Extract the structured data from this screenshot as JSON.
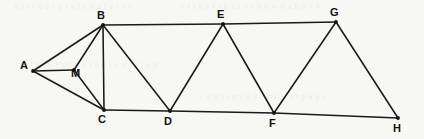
{
  "diagram": {
    "type": "node-link-geometry",
    "background_color": "#f7f7f4",
    "line_color": "#1a1a1a",
    "label_color": "#131313",
    "nodes": [
      {
        "id": "A",
        "label": "A",
        "x": 33,
        "y": 71,
        "label_x": 20,
        "label_y": 60
      },
      {
        "id": "M",
        "label": "M",
        "x": 74,
        "y": 70,
        "label_x": 71,
        "label_y": 68
      },
      {
        "id": "B",
        "label": "B",
        "x": 103,
        "y": 25,
        "label_x": 97,
        "label_y": 10
      },
      {
        "id": "C",
        "label": "C",
        "x": 104,
        "y": 110,
        "label_x": 98,
        "label_y": 114
      },
      {
        "id": "D",
        "label": "D",
        "x": 170,
        "y": 111,
        "label_x": 164,
        "label_y": 116
      },
      {
        "id": "E",
        "label": "E",
        "x": 223,
        "y": 24,
        "label_x": 217,
        "label_y": 9
      },
      {
        "id": "F",
        "label": "F",
        "x": 274,
        "y": 113,
        "label_x": 269,
        "label_y": 118
      },
      {
        "id": "G",
        "label": "G",
        "x": 336,
        "y": 22,
        "label_x": 330,
        "label_y": 7
      },
      {
        "id": "H",
        "label": "H",
        "x": 398,
        "y": 118,
        "label_x": 393,
        "label_y": 123
      }
    ],
    "edges": [
      {
        "from": "A",
        "to": "B"
      },
      {
        "from": "A",
        "to": "M"
      },
      {
        "from": "A",
        "to": "C"
      },
      {
        "from": "M",
        "to": "B"
      },
      {
        "from": "M",
        "to": "C"
      },
      {
        "from": "B",
        "to": "C"
      },
      {
        "from": "B",
        "to": "D"
      },
      {
        "from": "B",
        "to": "E"
      },
      {
        "from": "C",
        "to": "D"
      },
      {
        "from": "D",
        "to": "E"
      },
      {
        "from": "D",
        "to": "F"
      },
      {
        "from": "E",
        "to": "F"
      },
      {
        "from": "E",
        "to": "G"
      },
      {
        "from": "F",
        "to": "G"
      },
      {
        "from": "F",
        "to": "H"
      },
      {
        "from": "G",
        "to": "H"
      }
    ],
    "ghost_text": [
      {
        "text": "a  s  t  r  u  c  t  u  r  a  l   a  n  a  l  y  s  i  s",
        "x": 14,
        "y": 2
      },
      {
        "text": "o f   t h e   f i g u r e   s h o w n   a b o v e",
        "x": 180,
        "y": 2
      },
      {
        "text": "i  n   t  h  e   p  r  e  v  i  o  u  s   s  e  c  t  i  o  n",
        "x": 30,
        "y": 60
      },
      {
        "text": "c  o  n  t  i  n  u  e  d   o  n   n  e  x  t   p  a  g  e",
        "x": 200,
        "y": 92
      }
    ]
  }
}
